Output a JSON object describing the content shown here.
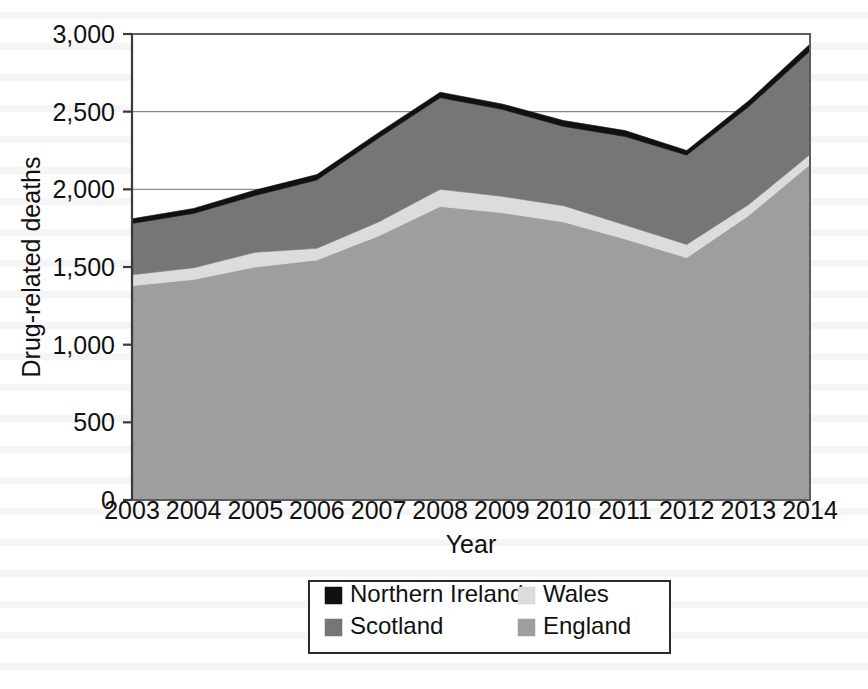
{
  "chart_data": {
    "type": "area",
    "stacked": true,
    "title": "",
    "xlabel": "Year",
    "ylabel": "Drug-related deaths",
    "x": [
      2003,
      2004,
      2005,
      2006,
      2007,
      2008,
      2009,
      2010,
      2011,
      2012,
      2013,
      2014
    ],
    "categories": [
      "2003",
      "2004",
      "2005",
      "2006",
      "2007",
      "2008",
      "2009",
      "2010",
      "2011",
      "2012",
      "2013",
      "2014"
    ],
    "xlim": [
      2003,
      2014
    ],
    "ylim": [
      0,
      3000
    ],
    "yticks": [
      0,
      500,
      1000,
      1500,
      2000,
      2500,
      3000
    ],
    "ytick_labels": [
      "0",
      "500",
      "1,000",
      "1,500",
      "2,000",
      "2,500",
      "3,000"
    ],
    "grid": "horizontal",
    "legend_position": "bottom",
    "stack_order_bottom_to_top": [
      "England",
      "Wales",
      "Scotland",
      "Northern Ireland"
    ],
    "series": [
      {
        "name": "England",
        "color": "#9e9e9e",
        "values": [
          1380,
          1420,
          1500,
          1545,
          1700,
          1890,
          1850,
          1790,
          1680,
          1560,
          1830,
          2160
        ]
      },
      {
        "name": "Wales",
        "color": "#dcdcdc",
        "values": [
          70,
          75,
          95,
          75,
          90,
          110,
          105,
          105,
          90,
          85,
          70,
          65
        ]
      },
      {
        "name": "Scotland",
        "color": "#767676",
        "values": [
          330,
          350,
          365,
          440,
          540,
          590,
          560,
          510,
          570,
          575,
          630,
          665
        ]
      },
      {
        "name": "Northern Ireland",
        "color": "#111111",
        "values": [
          30,
          32,
          35,
          35,
          35,
          35,
          35,
          38,
          38,
          30,
          38,
          45
        ]
      }
    ],
    "stacked_totals": [
      1810,
      1877,
      1995,
      2095,
      2365,
      2625,
      2550,
      2443,
      2378,
      2250,
      2568,
      2935
    ],
    "legend_entries": [
      {
        "label": "Northern Ireland",
        "color": "#111111"
      },
      {
        "label": "Wales",
        "color": "#dcdcdc"
      },
      {
        "label": "Scotland",
        "color": "#767676"
      },
      {
        "label": "England",
        "color": "#9e9e9e"
      }
    ]
  },
  "colors": {
    "england": "#9e9e9e",
    "wales": "#dcdcdc",
    "scotland": "#767676",
    "northern_ireland": "#111111",
    "gridline": "#8a8a8a",
    "frame": "#5d5d5d",
    "text": "#111111",
    "background": "#ffffff"
  }
}
